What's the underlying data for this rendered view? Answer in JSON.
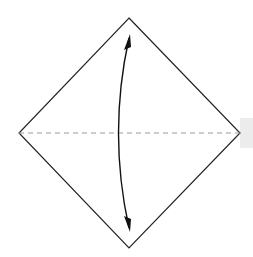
{
  "diagram": {
    "type": "origami-fold-instruction",
    "shape": "square-rotated-as-diamond",
    "vertices": {
      "top": [
        129,
        18
      ],
      "right": [
        240,
        133
      ],
      "bottom": [
        129,
        248
      ],
      "left": [
        19,
        133
      ]
    },
    "crease": {
      "style": "dashed",
      "from": [
        19,
        133
      ],
      "to": [
        240,
        133
      ],
      "color": "#999999"
    },
    "fold_arrow": {
      "style": "double-headed-curved",
      "from": [
        129,
        36
      ],
      "to": [
        129,
        232
      ],
      "bulge_x": 111,
      "color": "#111111"
    },
    "outline_color": "#222222",
    "edge_tab_color": "#ececec"
  }
}
